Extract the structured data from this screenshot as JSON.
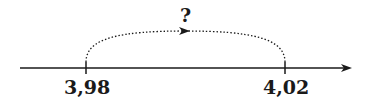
{
  "diagram": {
    "type": "number-line",
    "question_label": "?",
    "points": [
      {
        "label": "3,98",
        "value": 3.98
      },
      {
        "label": "4,02",
        "value": 4.02
      }
    ],
    "jump": {
      "from": "3,98",
      "to": "4,02",
      "style": "dotted",
      "label": "?"
    },
    "colors": {
      "line": "#1a1a1a",
      "background": "#ffffff"
    }
  }
}
